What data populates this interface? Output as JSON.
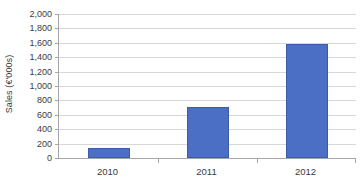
{
  "chart_data": {
    "type": "bar",
    "title": "",
    "subtitle": "",
    "xlabel": "",
    "ylabel": "Sales (€'000s)",
    "categories": [
      "2010",
      "2011",
      "2012"
    ],
    "values": [
      140,
      710,
      1590
    ],
    "series": [
      {
        "name": "Sales",
        "values": [
          140,
          710,
          1590
        ],
        "color": "#4a6fc4"
      }
    ],
    "ylim": [
      0,
      2000
    ],
    "ytick_step": 200,
    "ytick_labels": [
      "2,000",
      "1,800",
      "1,600",
      "1,400",
      "1,200",
      "1,000",
      "800",
      "600",
      "400",
      "200",
      "0"
    ],
    "ytick_values": [
      2000,
      1800,
      1600,
      1400,
      1200,
      1000,
      800,
      600,
      400,
      200,
      0
    ],
    "grid": "horizontal",
    "legend": "none",
    "annotations": [],
    "colors": {
      "bar_fill": "#4a6fc4",
      "bar_stroke": "#3a5ca8",
      "gridline": "#d8d8d8",
      "axis_line": "#a6a6a6",
      "text": "#3b3b3b",
      "background": "#ffffff"
    }
  }
}
